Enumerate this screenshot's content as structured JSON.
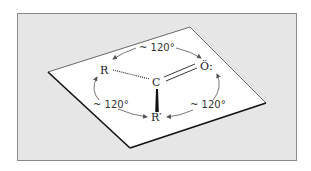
{
  "diagram": {
    "atoms": {
      "carbon": "C",
      "oxygen": "Ö:",
      "r_group": "R",
      "r_prime_group": "R′"
    },
    "angles": {
      "top": "~ 120°",
      "left": "~ 120°",
      "right": "~ 120°"
    },
    "colors": {
      "background_panel": "#e6e6e6",
      "plane": "#ffffff",
      "lines": "#111111",
      "arrows": "#555555"
    }
  }
}
